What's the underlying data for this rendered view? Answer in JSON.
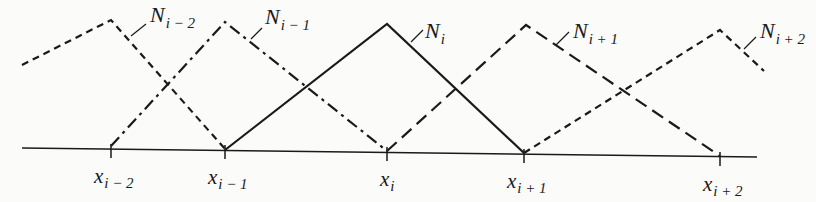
{
  "diagram": {
    "title": "",
    "colors": {
      "ink": "#1a1a1a",
      "background": "#fbfbfa"
    },
    "axis": {
      "x1": 22,
      "y1": 148,
      "x2": 757,
      "y2": 157
    },
    "nodes": [
      {
        "id": "x_im2",
        "base": "x",
        "sub": "i − 2",
        "x": 111,
        "y": 149
      },
      {
        "id": "x_im1",
        "base": "x",
        "sub": "i − 1",
        "x": 225,
        "y": 150
      },
      {
        "id": "x_i",
        "base": "x",
        "sub": "i",
        "x": 387,
        "y": 152
      },
      {
        "id": "x_ip1",
        "base": "x",
        "sub": "i + 1",
        "x": 524,
        "y": 154
      },
      {
        "id": "x_ip2",
        "base": "x",
        "sub": "i + 2",
        "x": 720,
        "y": 157
      }
    ],
    "basis_functions": [
      {
        "id": "N_im2",
        "base": "N",
        "sub": "i − 2",
        "style": "short-dash",
        "points": [
          [
            22,
            65
          ],
          [
            111,
            20
          ],
          [
            225,
            149
          ]
        ],
        "label_pos": [
          150,
          22
        ],
        "leader": [
          [
            131,
            36
          ],
          [
            146,
            24
          ]
        ]
      },
      {
        "id": "N_im1",
        "base": "N",
        "sub": "i − 1",
        "style": "dash-dot",
        "points": [
          [
            111,
            146
          ],
          [
            225,
            22
          ],
          [
            387,
            151
          ]
        ],
        "label_pos": [
          265,
          24
        ],
        "leader": [
          [
            251,
            39
          ],
          [
            262,
            28
          ]
        ]
      },
      {
        "id": "N_i",
        "base": "N",
        "sub": "i",
        "style": "solid",
        "points": [
          [
            225,
            150
          ],
          [
            387,
            24
          ],
          [
            524,
            153
          ]
        ],
        "label_pos": [
          425,
          38
        ],
        "leader": [
          [
            411,
            42
          ],
          [
            423,
            30
          ]
        ]
      },
      {
        "id": "N_ip1",
        "base": "N",
        "sub": "i + 1",
        "style": "long-dash",
        "points": [
          [
            387,
            151
          ],
          [
            526,
            25
          ],
          [
            720,
            156
          ]
        ],
        "label_pos": [
          573,
          38
        ],
        "leader": [
          [
            556,
            45
          ],
          [
            569,
            32
          ]
        ]
      },
      {
        "id": "N_ip2",
        "base": "N",
        "sub": "i + 2",
        "style": "short-dash",
        "points": [
          [
            524,
            153
          ],
          [
            720,
            30
          ],
          [
            764,
            71
          ]
        ],
        "label_pos": [
          760,
          38
        ],
        "leader": [
          [
            744,
            49
          ],
          [
            756,
            37
          ]
        ]
      }
    ]
  }
}
